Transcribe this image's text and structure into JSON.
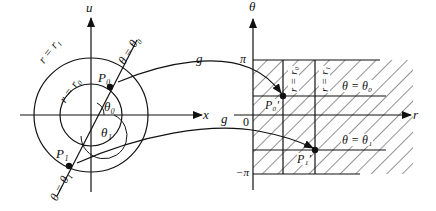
{
  "left_plane": {
    "vertical_axis_label": "u",
    "horizontal_axis_label": "x",
    "outer_circle_label": "r = r₁",
    "inner_circle_label": "r = r₀",
    "ray0_label": "θ = θ₀",
    "ray1_label": "θ = θ₁",
    "point0_label": "P₀",
    "point1_label": "P₁",
    "angle0_label": "θ₀",
    "angle1_label": "θ₁"
  },
  "mapping": {
    "arrow_top_label": "g",
    "arrow_bottom_label": "g"
  },
  "right_plane": {
    "vertical_axis_label": "θ",
    "horizontal_axis_label": "r",
    "top_tick_label": "π",
    "zero_label": "0",
    "bottom_tick_label": "−π",
    "line_r0_label": "r = r₀",
    "line_r1_label": "r = r₁",
    "line_theta0_label": "θ = θ₀",
    "line_theta1_label": "θ = θ₁",
    "point0_label": "P₀′",
    "point1_label": "P₁′"
  },
  "colors": {
    "ink": "#111111",
    "background": "#ffffff"
  }
}
